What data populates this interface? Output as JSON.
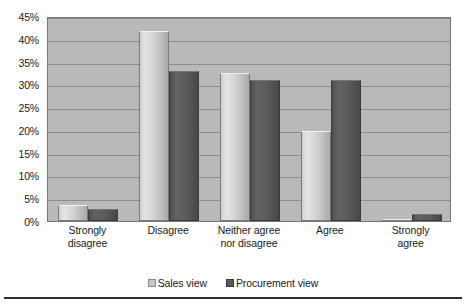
{
  "chart_data": {
    "type": "bar",
    "title": "",
    "subtitle": "",
    "xlabel": "",
    "ylabel": "",
    "ylim": [
      0,
      45
    ],
    "grid": true,
    "legend_position": "bottom-center",
    "categories": [
      "Strongly disagree",
      "Disagree",
      "Neither agree nor disagree",
      "Agree",
      "Strongly agree"
    ],
    "category_lines": [
      [
        "Strongly",
        "disagree"
      ],
      [
        "Disagree"
      ],
      [
        "Neither agree",
        "nor disagree"
      ],
      [
        "Agree"
      ],
      [
        "Strongly",
        "agree"
      ]
    ],
    "y_ticks": [
      0,
      5,
      10,
      15,
      20,
      25,
      30,
      35,
      40,
      45
    ],
    "y_tick_labels": [
      "0%",
      "5%",
      "10%",
      "15%",
      "20%",
      "25%",
      "30%",
      "35%",
      "40%",
      "45%"
    ],
    "series": [
      {
        "name": "Sales view",
        "color": "#d2d2d2",
        "values": [
          3.5,
          41.8,
          32.6,
          19.8,
          0.4
        ]
      },
      {
        "name": "Procurement view",
        "color": "#585858",
        "values": [
          2.6,
          32.9,
          30.9,
          30.9,
          1.6
        ]
      }
    ]
  },
  "legend": {
    "entries": [
      {
        "label": "Sales view",
        "swatch": "sales"
      },
      {
        "label": "Procurement view",
        "swatch": "procurement"
      }
    ]
  }
}
